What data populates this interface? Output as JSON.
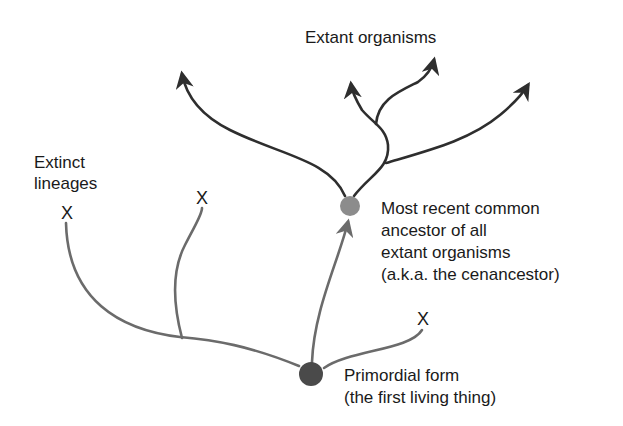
{
  "diagram": {
    "type": "phylogenetic-tree",
    "labels": {
      "extant": "Extant organisms",
      "extinct_line1": "Extinct",
      "extinct_line2": "lineages",
      "cenancestor_line1": "Most recent common",
      "cenancestor_line2": "ancestor of all",
      "cenancestor_line3": "extant organisms",
      "cenancestor_line4": "(a.k.a. the cenancestor)",
      "primordial_line1": "Primordial form",
      "primordial_line2": "(the first living thing)"
    },
    "extinct_marker": "X",
    "nodes": {
      "cenancestor": {
        "x": 350,
        "y": 206,
        "r": 10,
        "color": "#8c8c8c"
      },
      "primordial": {
        "x": 311,
        "y": 374,
        "r": 12,
        "color": "#4a4a4a"
      }
    },
    "colors": {
      "extant_branch": "#2e2e2e",
      "extinct_branch": "#6b6b6b",
      "text": "#1a1a1a"
    }
  }
}
